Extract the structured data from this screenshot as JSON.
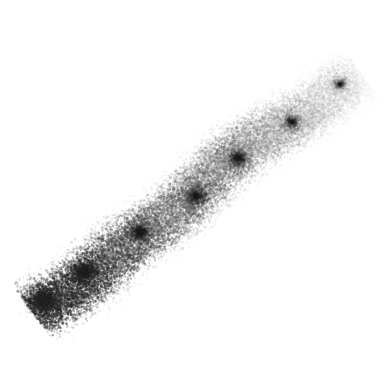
{
  "image": {
    "kind": "scanned-drawing",
    "title": "Diagonal pencil stroke",
    "width": 390,
    "height": 370,
    "background_color": "#ffffff",
    "medium": "graphite pencil / charcoal on white paper",
    "texture": "granular stippled grain",
    "has_text": false,
    "has_ui_chrome": false
  },
  "stroke": {
    "name": "diagonal-pencil-stroke",
    "description": "A single broad diagonal stroke running from the lower-left toward the upper-right, heavily pigmented at the lower-left tip and fading to faint gray at the upper-right tip.",
    "start_point": {
      "x": 32,
      "y": 312
    },
    "end_point": {
      "x": 360,
      "y": 72
    },
    "angle_degrees": -36,
    "length_px": 406,
    "band_width_px": 82,
    "direction": "lower-left to upper-right",
    "darkest_color": "#282828",
    "midtone_color": "#8a8a8a",
    "lightest_color": "#dcdcdc",
    "edge_softness": "feathered",
    "opacity_profile": [
      {
        "t": 0.0,
        "opacity": 0.95
      },
      {
        "t": 0.08,
        "opacity": 1.0
      },
      {
        "t": 0.2,
        "opacity": 0.86
      },
      {
        "t": 0.35,
        "opacity": 0.7
      },
      {
        "t": 0.5,
        "opacity": 0.62
      },
      {
        "t": 0.65,
        "opacity": 0.55
      },
      {
        "t": 0.8,
        "opacity": 0.4
      },
      {
        "t": 0.92,
        "opacity": 0.26
      },
      {
        "t": 1.0,
        "opacity": 0.14
      }
    ],
    "sub_bands": [
      {
        "name": "upper-dense-band",
        "offset_px": -21,
        "weight": 0.85,
        "note": "denser ridge along the upper side of the stroke"
      },
      {
        "name": "central-light-streak",
        "offset_px": 2,
        "weight": 0.28,
        "note": "lighter gap of reduced pigment through the middle"
      },
      {
        "name": "lower-dense-band",
        "offset_px": 22,
        "weight": 0.92,
        "note": "denser ridge along the lower side of the stroke"
      }
    ],
    "hotspots": [
      {
        "name": "lower-left-tip-blot",
        "x": 44,
        "y": 300,
        "radius": 26,
        "intensity": 1.0
      },
      {
        "name": "lower-left-shoulder",
        "x": 84,
        "y": 272,
        "radius": 22,
        "intensity": 0.8
      },
      {
        "name": "mid-lower-cluster",
        "x": 140,
        "y": 232,
        "radius": 20,
        "intensity": 0.62
      },
      {
        "name": "mid-center-cluster",
        "x": 196,
        "y": 196,
        "radius": 22,
        "intensity": 0.58
      },
      {
        "name": "mid-upper-cluster",
        "x": 238,
        "y": 158,
        "radius": 20,
        "intensity": 0.54
      },
      {
        "name": "upper-right-cluster",
        "x": 292,
        "y": 122,
        "radius": 18,
        "intensity": 0.4
      },
      {
        "name": "upper-right-tip-fleck",
        "x": 340,
        "y": 84,
        "radius": 15,
        "intensity": 0.3
      }
    ],
    "grain": {
      "particle_count": 26000,
      "particle_min_radius": 0.35,
      "particle_max_radius": 1.5,
      "random_seed": 20250614
    }
  },
  "canvas_labels": {
    "root_name": "drawing-canvas",
    "layer_name": "stroke-layer",
    "alt_text": "Granular diagonal graphite stroke on a white background"
  }
}
